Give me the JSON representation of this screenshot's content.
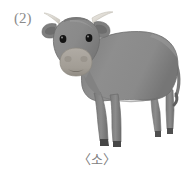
{
  "page": {
    "background_color": "#ffffff",
    "width": 194,
    "height": 175
  },
  "item_number": "(2)",
  "caption": "〈소〉",
  "illustration": {
    "name": "cow-illustration",
    "subject": "cow",
    "view": "front three-quarter, facing viewer",
    "alt_text": "Gray cow standing, facing forward",
    "colors": {
      "body": "#8a8a8a",
      "body_shadow": "#6f6f6f",
      "body_highlight": "#9a9a9a",
      "head": "#8d8d8d",
      "muzzle": "#a9a49e",
      "muzzle_shadow": "#8e8980",
      "horn": "#e6e3dc",
      "horn_shade": "#c8c4bc",
      "eye": "#141414",
      "nostril": "#6b6660",
      "hoof": "#4a4a4a",
      "ear_inner": "#6d6d6d",
      "outline": "#6a6a6a"
    },
    "parts": [
      "left-horn",
      "right-horn",
      "left-ear",
      "right-ear",
      "head",
      "left-eye",
      "right-eye",
      "muzzle",
      "left-nostril",
      "right-nostril",
      "mouth",
      "neck",
      "body",
      "tail",
      "front-left-leg",
      "front-right-leg",
      "hind-left-leg",
      "hind-right-leg",
      "hooves"
    ]
  }
}
